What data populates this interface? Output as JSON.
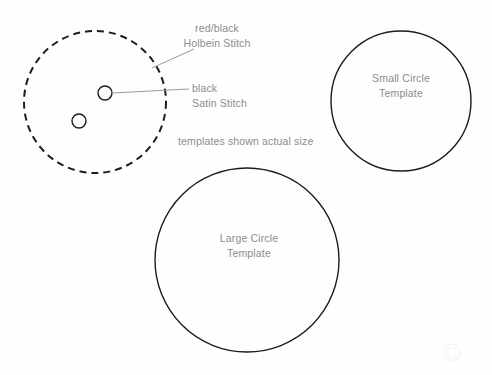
{
  "canvas": {
    "width": 492,
    "height": 375,
    "background": "#fefefe",
    "title": "Embroidery stitch placement diagram with circle templates"
  },
  "colors": {
    "stroke_dark": "#1c1c1c",
    "stroke_leader": "#9a9a9a",
    "text_gray": "#8c8c8c",
    "background": "#fefefe"
  },
  "annotations": {
    "holbein": {
      "line1": "red/black",
      "line2": "Holbein Stitch",
      "describes": "dashed-outer-circle"
    },
    "satin": {
      "line1": "black",
      "line2": "Satin Stitch",
      "describes": "upper-small-circle"
    },
    "actual_size_note": "templates shown actual size"
  },
  "templates": {
    "small": {
      "line1": "Small Circle",
      "line2": "Template",
      "center_x": 401,
      "center_y": 101,
      "radius": 70,
      "stroke": "#1c1c1c",
      "stroke_width": 1.4,
      "style": "solid"
    },
    "large": {
      "line1": "Large Circle",
      "line2": "Template",
      "center_x": 247,
      "center_y": 260,
      "radius": 92,
      "stroke": "#1c1c1c",
      "stroke_width": 1.4,
      "style": "solid"
    }
  },
  "stitch_diagram": {
    "outer_circle": {
      "name": "dashed-outer-circle",
      "center_x": 95,
      "center_y": 102,
      "radius": 71,
      "stroke": "#1c1c1c",
      "stroke_width": 2,
      "style": "dashed",
      "dash_pattern": "7 5"
    },
    "dots": [
      {
        "name": "upper-small-circle",
        "center_x": 105,
        "center_y": 93,
        "radius": 7,
        "stroke": "#1c1c1c",
        "stroke_width": 1.4
      },
      {
        "name": "lower-small-circle",
        "center_x": 79,
        "center_y": 121,
        "radius": 7,
        "stroke": "#1c1c1c",
        "stroke_width": 1.4
      }
    ],
    "leaders": [
      {
        "name": "holbein-leader-line",
        "x1": 152,
        "y1": 68,
        "x2": 194,
        "y2": 49,
        "stroke": "#9a9a9a"
      },
      {
        "name": "satin-leader-line",
        "x1": 112,
        "y1": 93,
        "x2": 189,
        "y2": 89,
        "stroke": "#9a9a9a"
      }
    ]
  },
  "watermark": {
    "text": "©"
  }
}
